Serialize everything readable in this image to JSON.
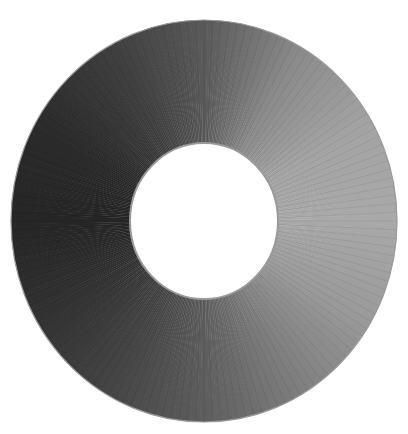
{
  "figure": {
    "width": 408,
    "height": 434,
    "background": "#ffffff",
    "ring": {
      "center": [
        204,
        221
      ],
      "outer_rx": 193,
      "outer_ry": 201,
      "inner_rx": 74,
      "inner_ry": 78,
      "edge_color": "#9a9a9a"
    },
    "hole_color": "#ffffff",
    "gradient_stops": [
      {
        "angle": 0,
        "color": "#5a5a5a"
      },
      {
        "angle": 30,
        "color": "#8a8a8a"
      },
      {
        "angle": 60,
        "color": "#a3a3a3"
      },
      {
        "angle": 90,
        "color": "#a9a9a9"
      },
      {
        "angle": 120,
        "color": "#9a9a9a"
      },
      {
        "angle": 150,
        "color": "#7e7e7e"
      },
      {
        "angle": 180,
        "color": "#5e5e5e"
      },
      {
        "angle": 210,
        "color": "#454545"
      },
      {
        "angle": 240,
        "color": "#323232"
      },
      {
        "angle": 270,
        "color": "#262626"
      },
      {
        "angle": 300,
        "color": "#2b2b2b"
      },
      {
        "angle": 330,
        "color": "#3e3e3e"
      },
      {
        "angle": 360,
        "color": "#5a5a5a"
      }
    ],
    "hatch": {
      "count": 144,
      "color": "#000000",
      "opacity": 0.12
    }
  }
}
